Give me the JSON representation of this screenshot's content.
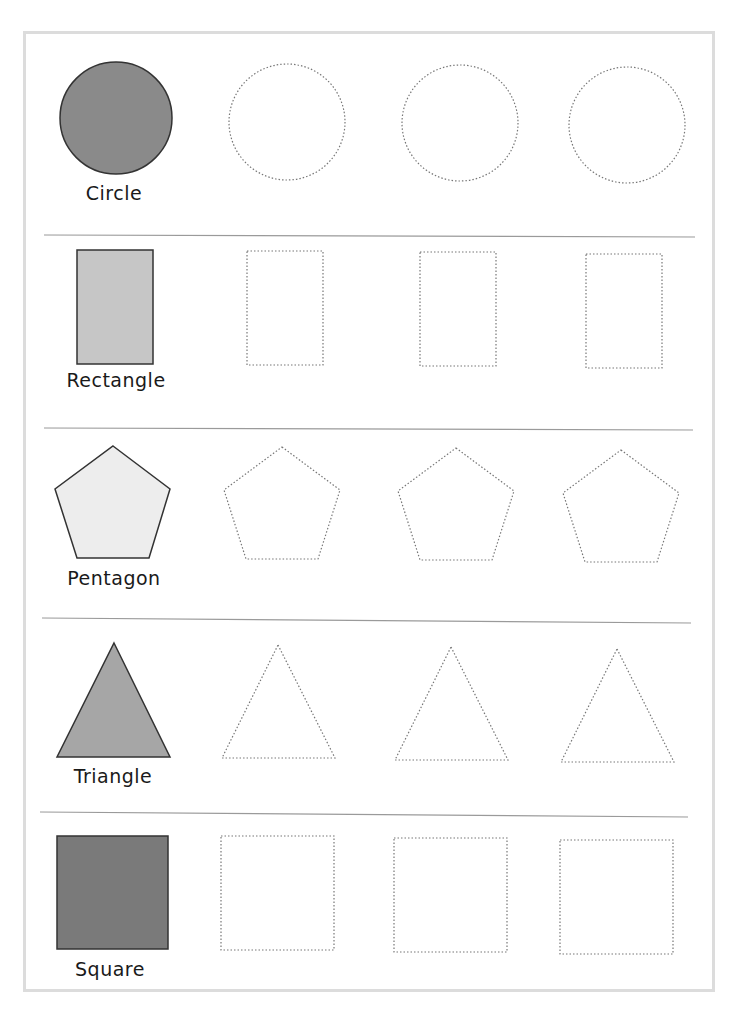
{
  "worksheet": {
    "rows": [
      {
        "label": "Circle",
        "fill": "#8a8a8a",
        "traces": 3
      },
      {
        "label": "Rectangle",
        "fill": "#c6c6c6",
        "traces": 3
      },
      {
        "label": "Pentagon",
        "fill": "#ededed",
        "traces": 3
      },
      {
        "label": "Triangle",
        "fill": "#a6a6a6",
        "traces": 3
      },
      {
        "label": "Square",
        "fill": "#7a7a7a",
        "traces": 3
      }
    ],
    "colors": {
      "outline": "#333333",
      "dotted": "#777777",
      "divider": "#9a9a9a",
      "frame": "#dcdcdc"
    }
  }
}
